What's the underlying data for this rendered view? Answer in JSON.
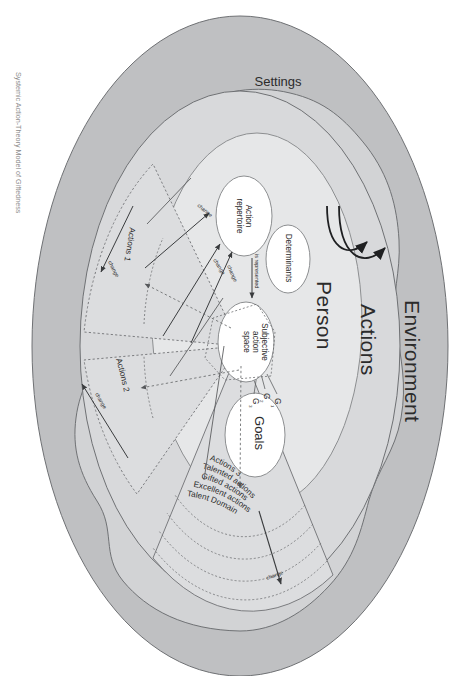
{
  "figure": {
    "title_caption": "Systemic Action-Theory Model of Giftedness",
    "orientation_note": "rotated-180",
    "background": "#ffffff"
  },
  "colors": {
    "outer_band": "#bfc0c2",
    "actions_ring": "#d2d3d5",
    "person_ellipse": "#e3e4e5",
    "inner_oval_fill": "#ffffff",
    "stroke": "#5d5f61",
    "text": "#2b2b2b",
    "dashed": "#6e7072",
    "caption": "#8d8d8d"
  },
  "layers": {
    "environment": {
      "label": "Environment",
      "regions": [
        {
          "id": "social",
          "label": "Social"
        },
        {
          "id": "persons",
          "label": "Persons"
        },
        {
          "id": "objects",
          "label": "Objects"
        },
        {
          "id": "settings",
          "label": "Settings"
        }
      ]
    },
    "actions_ring": {
      "label": "Actions",
      "sectors": [
        {
          "id": "actions-1",
          "label": "Actions 1"
        },
        {
          "id": "actions-2",
          "label": "Actions 2"
        },
        {
          "id": "actions-3",
          "label": "Actions 3"
        }
      ],
      "quality_bands": [
        {
          "id": "talented-actions",
          "label": "Talented actions"
        },
        {
          "id": "gifted-actions",
          "label": "Gifted actions"
        },
        {
          "id": "excellent-actions",
          "label": "Excellent actions"
        },
        {
          "id": "talent-domain",
          "label": "Talent Domain"
        }
      ]
    },
    "person": {
      "label": "Person",
      "components": [
        {
          "id": "goals",
          "label": "Goals"
        },
        {
          "id": "subjective-action-space",
          "label": "Subjective action space"
        },
        {
          "id": "determinants",
          "label": "Determinants"
        },
        {
          "id": "action-repertoire",
          "label": "Action repertoire"
        }
      ],
      "goal_nodes": [
        {
          "id": "g1",
          "label": "G",
          "sub": "1"
        },
        {
          "id": "g2",
          "label": "G",
          "sub": "2"
        },
        {
          "id": "g3",
          "label": "G",
          "sub": "3"
        }
      ]
    }
  },
  "edge_labels": {
    "is_represented": "is represented",
    "change": "change",
    "change_list": [
      "change",
      "change",
      "change",
      "change",
      "change"
    ]
  }
}
